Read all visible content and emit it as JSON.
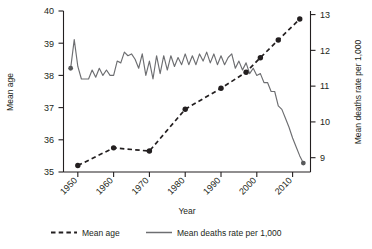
{
  "chart_data": {
    "type": "line",
    "title": "",
    "xlabel": "Year",
    "grid": false,
    "legend_position": "bottom",
    "x_ticks": [
      "1950",
      "1960",
      "1970",
      "1980",
      "1990",
      "2000",
      "2010"
    ],
    "x_tick_values": [
      1950,
      1960,
      1970,
      1980,
      1990,
      2000,
      2010
    ],
    "xlim": [
      1946,
      2015
    ],
    "axes": [
      {
        "id": "left",
        "ylabel": "Mean age",
        "ylim": [
          35,
          40
        ],
        "ticks": [
          "35",
          "36",
          "37",
          "38",
          "39",
          "40"
        ],
        "tick_values": [
          35,
          36,
          37,
          38,
          39,
          40
        ]
      },
      {
        "id": "right",
        "ylabel": "Mean deaths rate per 1,000",
        "ylim": [
          8.6,
          13.1
        ],
        "ticks": [
          "9",
          "10",
          "11",
          "12",
          "13"
        ],
        "tick_values": [
          9,
          10,
          11,
          12,
          13
        ]
      }
    ],
    "series": [
      {
        "name": "Mean age",
        "axis": "left",
        "style": "dashed",
        "marker": "circle",
        "color": "#231f20",
        "x": [
          1950,
          1960,
          1970,
          1980,
          1990,
          1997,
          2001,
          2006,
          2012
        ],
        "values": [
          35.2,
          35.75,
          35.65,
          36.95,
          37.6,
          38.1,
          38.55,
          39.1,
          39.75
        ]
      },
      {
        "name": "Mean deaths rate per 1,000",
        "axis": "right",
        "style": "solid",
        "marker": "none",
        "color": "#6d6e71",
        "x": [
          1948,
          1949,
          1950,
          1951,
          1952,
          1953,
          1954,
          1955,
          1956,
          1957,
          1958,
          1959,
          1960,
          1961,
          1962,
          1963,
          1964,
          1965,
          1966,
          1967,
          1968,
          1969,
          1970,
          1971,
          1972,
          1973,
          1974,
          1975,
          1976,
          1977,
          1978,
          1979,
          1980,
          1981,
          1982,
          1983,
          1984,
          1985,
          1986,
          1987,
          1988,
          1989,
          1990,
          1991,
          1992,
          1993,
          1994,
          1995,
          1996,
          1997,
          1998,
          1999,
          2000,
          2001,
          2002,
          2003,
          2004,
          2005,
          2006,
          2007,
          2008,
          2009,
          2010,
          2011,
          2012,
          2013
        ],
        "values": [
          11.5,
          12.3,
          11.55,
          11.2,
          11.2,
          11.2,
          11.45,
          11.25,
          11.5,
          11.3,
          11.45,
          11.3,
          11.3,
          11.7,
          11.65,
          11.95,
          11.85,
          11.9,
          11.75,
          11.5,
          11.9,
          11.3,
          11.7,
          11.2,
          11.85,
          11.35,
          11.85,
          11.45,
          11.85,
          11.55,
          11.8,
          11.6,
          11.9,
          11.6,
          11.85,
          11.6,
          11.9,
          11.7,
          11.95,
          11.65,
          11.9,
          11.6,
          11.85,
          11.6,
          11.8,
          11.9,
          11.5,
          11.7,
          11.45,
          11.65,
          11.35,
          11.5,
          11.3,
          11.35,
          11.1,
          11.1,
          10.85,
          10.85,
          10.45,
          10.35,
          10.1,
          9.85,
          9.55,
          9.3,
          9.05,
          8.85
        ],
        "start_marker": {
          "x": 1948,
          "value": 11.5
        },
        "end_marker": {
          "x": 2013,
          "value": 8.85
        }
      }
    ],
    "legend": [
      {
        "label": "Mean age",
        "style": "dashed",
        "color": "#231f20"
      },
      {
        "label": "Mean deaths rate per 1,000",
        "style": "solid",
        "color": "#6d6e71"
      }
    ]
  }
}
